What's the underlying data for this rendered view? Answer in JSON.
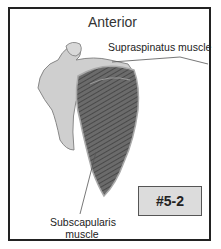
{
  "figure": {
    "title": "Anterior",
    "labels": {
      "supraspinatus": "Supraspinatus muscle",
      "subscapularis_line1": "Subscapularis",
      "subscapularis_line2": "muscle"
    },
    "badge": "#5-2"
  }
}
